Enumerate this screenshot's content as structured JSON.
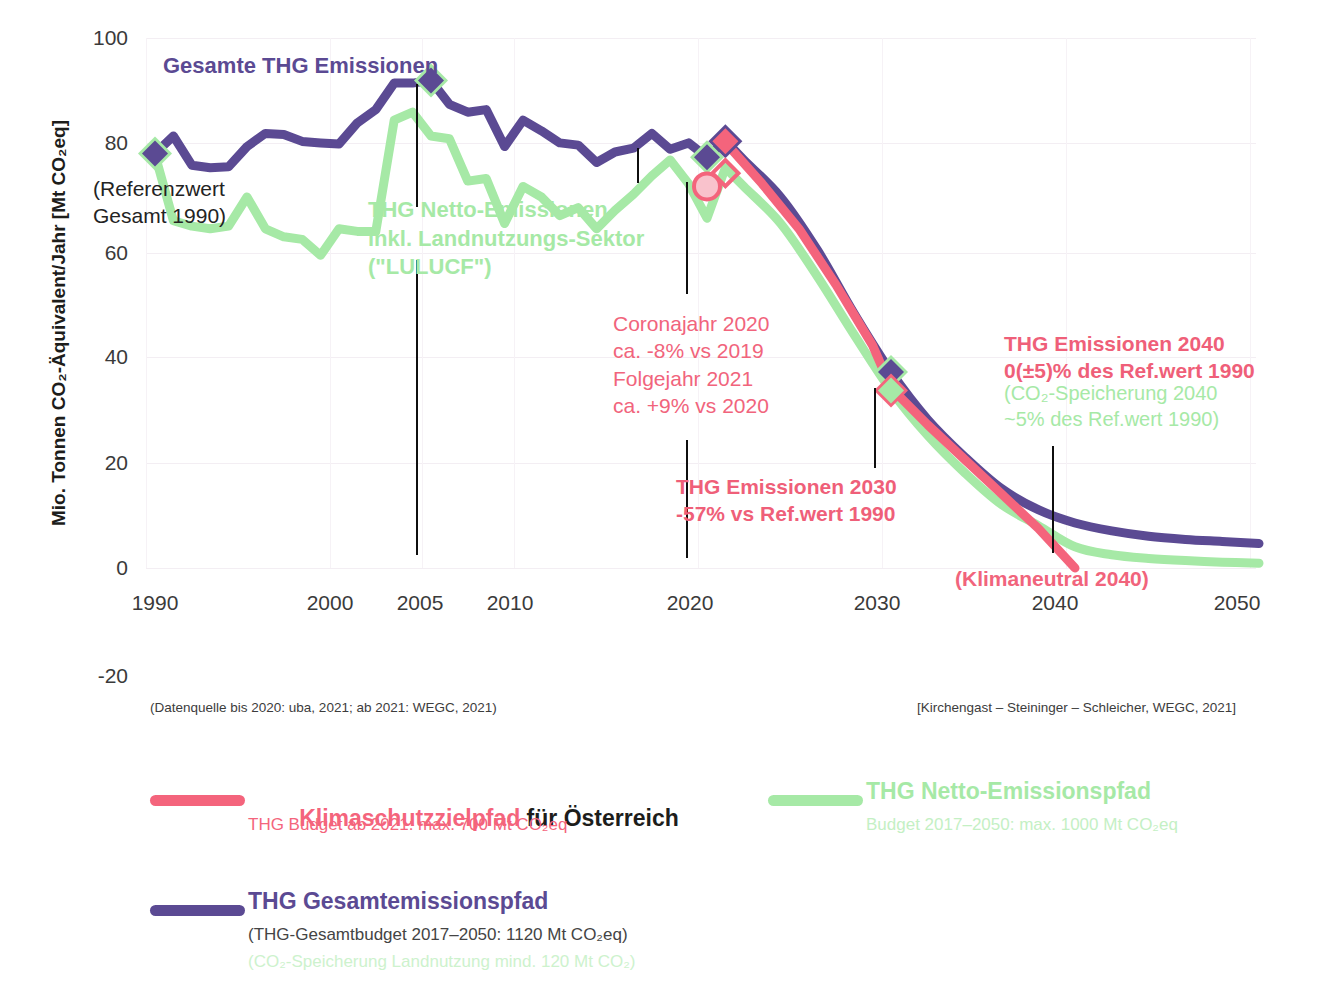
{
  "axes": {
    "y_title": "Mio. Tonnen CO₂-Äquivalent/Jahr [Mt CO₂eq]",
    "y_ticks": [
      "100",
      "80",
      "60",
      "40",
      "20",
      "0",
      "-20"
    ],
    "x_ticks": [
      "1990",
      "2000",
      "2005",
      "2010",
      "2020",
      "2030",
      "2040",
      "2050"
    ]
  },
  "annotations": {
    "total_label": "Gesamte THG Emissionen",
    "reference_label": "(Referenzwert\nGesamt 1990)",
    "net_label": "THG Netto-Emissionen\ninkl. Landnutzungs-Sektor\n(\"LULUCF\")",
    "corona_label": "Coronajahr 2020\nca. -8% vs 2019\nFolgejahr 2021\nca. +9% vs 2020",
    "target_2030_label": "THG Emissionen 2030\n-57% vs Ref.wert 1990",
    "target_2040_label": "THG Emissionen 2040\n0(±5)% des Ref.wert 1990",
    "storage_2040_label": "(CO₂-Speicherung 2040\n~5% des Ref.wert 1990)",
    "klimaneutral_label": "(Klimaneutral 2040)"
  },
  "notes": {
    "source": "(Datenquelle bis 2020: uba, 2021; ab 2021: WEGC, 2021)",
    "credit": "[Kirchengast – Steininger – Schleicher, WEGC, 2021]"
  },
  "legend": {
    "items": [
      {
        "name": "klimaschutzzielpfad",
        "color": "#f4647c",
        "title_highlight": "Klimaschutzzielpfad",
        "title_rest": " für Österreich",
        "subtitle": "THG Budget ab 2021: max. 700 Mt CO₂eq",
        "subtitle2": ""
      },
      {
        "name": "thg-netto-emissionspfad",
        "color": "#a6e9a6",
        "title_highlight": "THG Netto-Emissionspfad",
        "title_rest": "",
        "subtitle": "Budget 2017–2050: max. 1000 Mt CO₂eq",
        "subtitle2": ""
      },
      {
        "name": "thg-gesamtemissionspfad",
        "color": "#5b4a93",
        "title_highlight": "THG Gesamtemissionspfad",
        "title_rest": "",
        "subtitle": "(THG-Gesamtbudget 2017–2050: 1120 Mt CO₂eq)",
        "subtitle2": "(CO₂-Speicherung Landnutzung mind. 120 Mt CO₂)"
      }
    ]
  },
  "colors": {
    "purple": "#5b4a93",
    "green": "#a6e9a6",
    "red": "#f4647c",
    "text": "#2b2b2b"
  },
  "chart_data": {
    "type": "line",
    "title": "",
    "xlabel": "",
    "ylabel": "Mio. Tonnen CO₂-Äquivalent/Jahr [Mt CO₂eq]",
    "xlim": [
      1989,
      2051
    ],
    "ylim": [
      -20,
      100
    ],
    "grid": true,
    "legend_position": "bottom",
    "series": [
      {
        "name": "THG Gesamtemissionspfad",
        "color": "#5b4a93",
        "x": [
          1990,
          1991,
          1992,
          1993,
          1994,
          1995,
          1996,
          1997,
          1998,
          1999,
          2000,
          2001,
          2002,
          2003,
          2004,
          2005,
          2006,
          2007,
          2008,
          2009,
          2010,
          2011,
          2012,
          2013,
          2014,
          2015,
          2016,
          2017,
          2018,
          2019,
          2020,
          2021,
          2022,
          2024,
          2026,
          2028,
          2030,
          2032,
          2034,
          2036,
          2038,
          2040,
          2042,
          2044,
          2046,
          2048,
          2050
        ],
        "y": [
          78.2,
          81.5,
          76.0,
          75.5,
          75.7,
          79.5,
          82.0,
          81.8,
          80.5,
          80.2,
          80.0,
          84.0,
          86.5,
          91.5,
          91.5,
          92.0,
          87.5,
          86.0,
          86.5,
          79.5,
          84.5,
          82.5,
          80.2,
          79.8,
          76.5,
          78.5,
          79.2,
          82.0,
          79.0,
          80.2,
          77.5,
          80.6,
          77.0,
          70.0,
          60.0,
          48.0,
          37.0,
          28.0,
          21.0,
          15.0,
          11.0,
          8.5,
          7.0,
          6.0,
          5.4,
          5.0,
          4.6
        ]
      },
      {
        "name": "THG Netto-Emissionspfad (inkl. LULUCF)",
        "color": "#a6e9a6",
        "x": [
          1990,
          1991,
          1992,
          1993,
          1994,
          1995,
          1996,
          1997,
          1998,
          1999,
          2000,
          2001,
          2002,
          2003,
          2004,
          2005,
          2006,
          2007,
          2008,
          2009,
          2010,
          2011,
          2012,
          2013,
          2014,
          2015,
          2016,
          2017,
          2018,
          2019,
          2020,
          2021,
          2022,
          2024,
          2026,
          2028,
          2030,
          2032,
          2034,
          2036,
          2038,
          2040,
          2042,
          2044,
          2046,
          2048,
          2050
        ],
        "y": [
          78.0,
          65.5,
          64.5,
          64.0,
          64.5,
          70.0,
          64.0,
          62.5,
          62.0,
          59.0,
          64.0,
          63.5,
          63.5,
          84.5,
          86.0,
          81.5,
          81.0,
          73.0,
          73.5,
          65.0,
          72.0,
          70.0,
          66.5,
          68.0,
          64.0,
          67.5,
          70.5,
          74.0,
          77.0,
          72.5,
          66.0,
          75.5,
          72.0,
          65.0,
          55.0,
          44.0,
          33.5,
          25.0,
          18.0,
          12.0,
          8.0,
          4.0,
          2.5,
          1.8,
          1.4,
          1.1,
          0.9
        ]
      },
      {
        "name": "Klimaschutzzielpfad für Österreich",
        "color": "#f4647c",
        "x": [
          2021,
          2023,
          2025,
          2027,
          2029,
          2030,
          2032,
          2034,
          2036,
          2038,
          2040
        ],
        "y": [
          80.3,
          72.5,
          64.0,
          53.5,
          42.0,
          34.0,
          27.0,
          20.5,
          14.0,
          7.5,
          0.0
        ]
      }
    ],
    "markers": [
      {
        "name": "ref-1990-purple",
        "x": 1990,
        "y": 78.2,
        "shape": "diamond",
        "fill": "#5b4a93",
        "halo": "#a6e9a6"
      },
      {
        "name": "peak-2005-purple",
        "x": 2005,
        "y": 92.0,
        "shape": "diamond",
        "fill": "#5b4a93",
        "halo": "#a6e9a6"
      },
      {
        "name": "y2020-purple",
        "x": 2020,
        "y": 77.5,
        "shape": "diamond",
        "fill": "#5b4a93",
        "halo": "#a6e9a6"
      },
      {
        "name": "y2020-corona-circle",
        "x": 2020,
        "y": 72.0,
        "shape": "circle",
        "fill": "#f9c2cc",
        "halo": "#f4647c"
      },
      {
        "name": "y2021-red",
        "x": 2021,
        "y": 80.5,
        "shape": "diamond",
        "fill": "#f4647c",
        "halo": "#5b4a93"
      },
      {
        "name": "y2021-red-open",
        "x": 2021,
        "y": 74.5,
        "shape": "diamond-open",
        "fill": "none",
        "halo": "#f4647c"
      },
      {
        "name": "y2030-purple",
        "x": 2030,
        "y": 37.0,
        "shape": "diamond",
        "fill": "#5b4a93",
        "halo": "#a6e9a6"
      },
      {
        "name": "y2030-green",
        "x": 2030,
        "y": 33.5,
        "shape": "diamond",
        "fill": "#a6e9a6",
        "halo": "#f4647c"
      }
    ]
  }
}
